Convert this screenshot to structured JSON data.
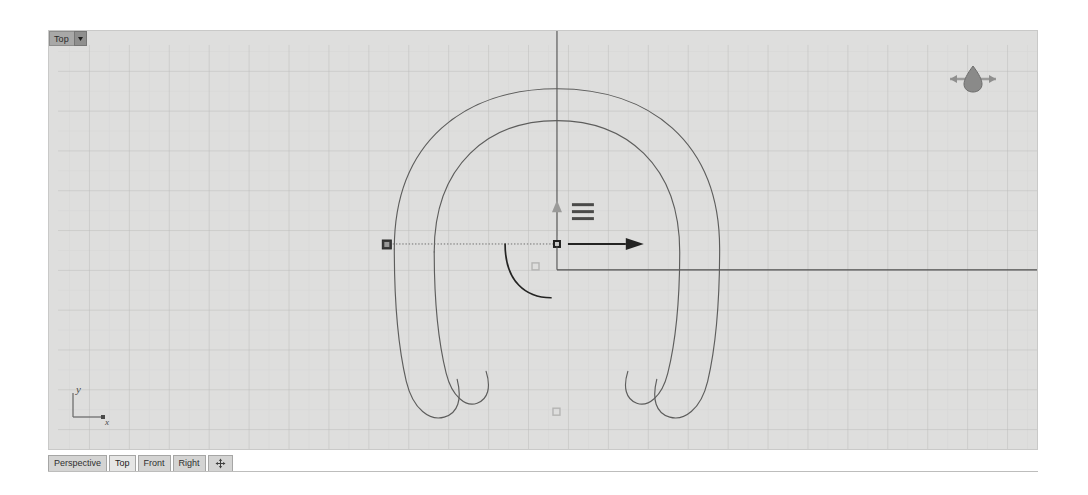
{
  "app": {
    "name": "Rhino 3D viewport",
    "background_color": "#ffffff"
  },
  "viewport": {
    "name": "Top",
    "title_label": "Top",
    "dropdown_icon": "chevron-down-icon",
    "background_color": "#dededd",
    "grid": {
      "minor_line_color": "#d2d2d1",
      "major_line_color": "#bcbcbb",
      "axis_line_color": "#8d8d8c",
      "minor_spacing_px": 20,
      "major_every": 2,
      "visible": true
    },
    "projection": "parallel-top"
  },
  "compass": {
    "name": "north-compass-widget",
    "pointer_color": "#8c8c8b",
    "bar_color": "#9a9a99"
  },
  "world_axes": {
    "name": "world-axes-icon",
    "x_label": "x",
    "y_label": "y",
    "color": "#6f6f6e"
  },
  "gumball": {
    "name": "gumball-widget",
    "origin_x": 557,
    "origin_y": 244,
    "menu_icon": "hamburger-menu-icon",
    "x_axis_arrow_color": "#2b2b2b",
    "y_axis_arrow_color": "#8a8a89",
    "drag_handle_color": "#3a3a39",
    "rotation_arc_color": "#2b2b2b",
    "scale_handle_color": "#b0b0af"
  },
  "geometry": {
    "name": "horseshoe-curve",
    "stroke_color": "#5d5d5c",
    "stroke_width": 1,
    "description": "Two concentric horseshoe arcs with rounded looped tips"
  },
  "construction_lines": {
    "vertical_color": "#4d4d4c",
    "horizontal_color": "#4d4d4c",
    "dotted_color": "#6b6b6a"
  },
  "tabbar": {
    "tabs": [
      {
        "label": "Perspective",
        "active": false,
        "name": "tab-perspective"
      },
      {
        "label": "Top",
        "active": true,
        "name": "tab-top"
      },
      {
        "label": "Front",
        "active": false,
        "name": "tab-front"
      },
      {
        "label": "Right",
        "active": false,
        "name": "tab-right"
      }
    ],
    "add_tab_icon": "four-arrows-move-icon"
  }
}
